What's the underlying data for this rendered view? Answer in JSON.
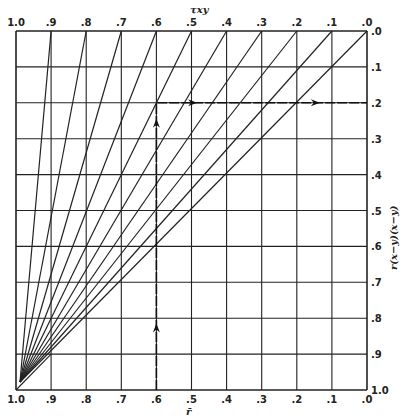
{
  "chart_data": {
    "type": "line",
    "title": "",
    "top_axis": {
      "label": "τxy",
      "ticks": [
        "1.0",
        ".9",
        ".8",
        ".7",
        ".6",
        ".5",
        ".4",
        ".3",
        ".2",
        ".1",
        ".0"
      ]
    },
    "bottom_axis": {
      "label": "r̄",
      "ticks": [
        "1.0",
        ".9",
        ".8",
        ".7",
        ".6",
        ".5",
        ".4",
        ".3",
        ".2",
        ".1",
        ".0"
      ]
    },
    "right_axis": {
      "label": "r(x−y)(x−y)",
      "ticks": [
        ".0",
        ".1",
        ".2",
        ".3",
        ".4",
        ".5",
        ".6",
        ".7",
        ".8",
        ".9",
        "1.0"
      ]
    },
    "xlim": [
      1.0,
      0.0
    ],
    "ylim": [
      0.0,
      1.0
    ],
    "grid": true,
    "series": [
      {
        "name": "τxy=.9",
        "from": [
          1.0,
          1.0
        ],
        "to": [
          0.9,
          0.0
        ]
      },
      {
        "name": "τxy=.8",
        "from": [
          1.0,
          1.0
        ],
        "to": [
          0.8,
          0.0
        ]
      },
      {
        "name": "τxy=.7",
        "from": [
          1.0,
          1.0
        ],
        "to": [
          0.7,
          0.0
        ]
      },
      {
        "name": "τxy=.6",
        "from": [
          1.0,
          1.0
        ],
        "to": [
          0.6,
          0.0
        ]
      },
      {
        "name": "τxy=.5",
        "from": [
          1.0,
          1.0
        ],
        "to": [
          0.5,
          0.0
        ]
      },
      {
        "name": "τxy=.4",
        "from": [
          1.0,
          1.0
        ],
        "to": [
          0.4,
          0.0
        ]
      },
      {
        "name": "τxy=.3",
        "from": [
          1.0,
          1.0
        ],
        "to": [
          0.3,
          0.0
        ]
      },
      {
        "name": "τxy=.2",
        "from": [
          1.0,
          1.0
        ],
        "to": [
          0.2,
          0.0
        ]
      },
      {
        "name": "τxy=.1",
        "from": [
          1.0,
          1.0
        ],
        "to": [
          0.1,
          0.0
        ]
      },
      {
        "name": "τxy=.0",
        "from": [
          1.0,
          1.0
        ],
        "to": [
          0.0,
          0.0
        ]
      }
    ],
    "annotations": [
      {
        "type": "arrow-path",
        "description": "vertical from r̄=.6 at bottom up to .2, then horizontal right to right edge at .2",
        "points": [
          [
            0.6,
            1.0
          ],
          [
            0.6,
            0.2
          ],
          [
            0.0,
            0.2
          ]
        ],
        "arrows": [
          [
            0.6,
            0.82
          ],
          [
            0.6,
            0.25
          ],
          [
            0.49,
            0.2
          ],
          [
            0.14,
            0.2
          ]
        ]
      }
    ]
  }
}
